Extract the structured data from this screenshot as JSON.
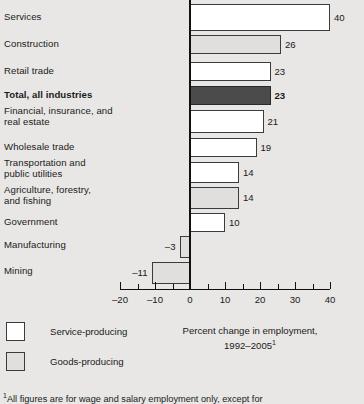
{
  "chart_data": {
    "type": "bar",
    "orientation": "horizontal",
    "title": "Percent change in employment, 1992–2005",
    "title_superscript": "1",
    "xlabel": "",
    "ylabel": "",
    "xlim": [
      -20,
      40
    ],
    "xticks": [
      -20,
      -10,
      0,
      10,
      20,
      30,
      40
    ],
    "xtick_labels": [
      "–20",
      "–10",
      "0",
      "10",
      "20",
      "30",
      "40"
    ],
    "minor_tick_interval": 5,
    "grid": false,
    "legend_position": "bottom-left",
    "categories": [
      "Services",
      "Construction",
      "Retail trade",
      "Total, all industries",
      "Financial, insurance, and\nreal estate",
      "Wholesale trade",
      "Transportation and\npublic utilities",
      "Agriculture, forestry,\nand fishing",
      "Government",
      "Manufacturing",
      "Mining"
    ],
    "values": [
      40,
      26,
      23,
      23,
      21,
      19,
      14,
      14,
      10,
      -3,
      -11
    ],
    "value_labels": [
      "40",
      "26",
      "23",
      "23",
      "21",
      "19",
      "14",
      "14",
      "10",
      "–3",
      "–11"
    ],
    "series_group": [
      "service",
      "goods",
      "service",
      "total",
      "service",
      "service",
      "service",
      "goods",
      "service",
      "goods",
      "goods"
    ],
    "emphasis": [
      false,
      false,
      false,
      true,
      false,
      false,
      false,
      false,
      false,
      false,
      false
    ],
    "legend": [
      {
        "key": "service",
        "label": "Service-producing",
        "color": "#ffffff"
      },
      {
        "key": "goods",
        "label": "Goods-producing",
        "color": "#e0dfdd"
      }
    ],
    "total_bar_color": "#4b4b4b",
    "border_color": "#3b3b3b",
    "background_color": "#e8e7e5"
  },
  "footnote": {
    "marker": "1",
    "text": "All figures are for wage and salary employment only, except for"
  }
}
